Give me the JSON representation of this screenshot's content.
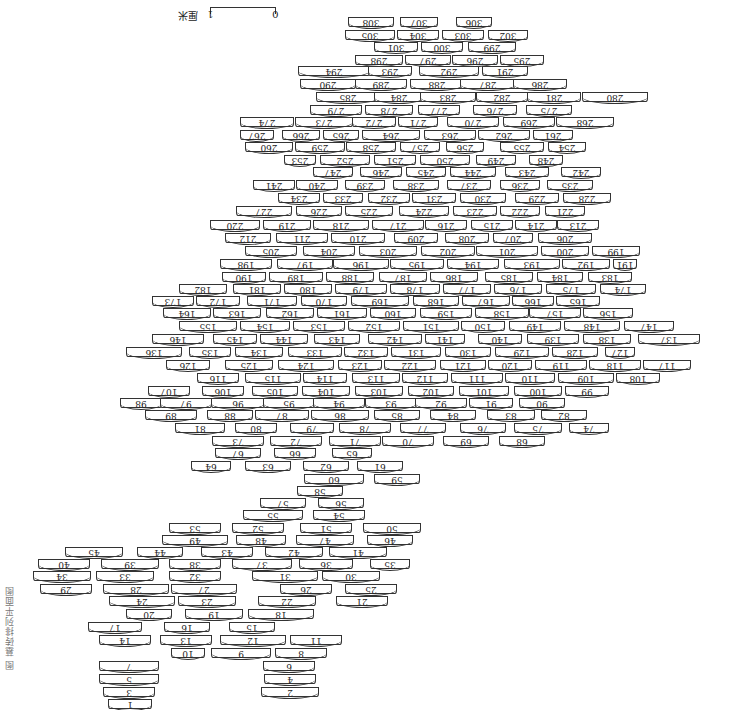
{
  "figure": {
    "orientation": "rotated 180°",
    "scale_bar": {
      "start": "0",
      "end": "1",
      "unit": "厘米"
    },
    "caption": "图 墓砖排列平面图"
  },
  "bricks": [
    [
      "308",
      348,
      17,
      46
    ],
    [
      "307",
      400,
      17,
      38
    ],
    [
      "306",
      456,
      17,
      36
    ],
    [
      "305",
      345,
      30,
      50
    ],
    [
      "304",
      397,
      30,
      42
    ],
    [
      "303",
      442,
      30,
      42
    ],
    [
      "302",
      488,
      30,
      40
    ],
    [
      "301",
      374,
      42,
      44
    ],
    [
      "300",
      421,
      42,
      42
    ],
    [
      "299",
      468,
      42,
      48
    ],
    [
      "298",
      355,
      55,
      48
    ],
    [
      "297",
      405,
      55,
      46
    ],
    [
      "296",
      452,
      55,
      46
    ],
    [
      "295",
      500,
      55,
      44
    ],
    [
      "294",
      298,
      66,
      72
    ],
    [
      "293",
      368,
      66,
      44
    ],
    [
      "292",
      419,
      66,
      60
    ],
    [
      "291",
      482,
      66,
      46
    ],
    [
      "290",
      300,
      79,
      56
    ],
    [
      "289",
      355,
      79,
      52
    ],
    [
      "288",
      410,
      79,
      54
    ],
    [
      "287",
      460,
      79,
      56
    ],
    [
      "286",
      513,
      79,
      54
    ],
    [
      "285",
      316,
      92,
      64
    ],
    [
      "284",
      374,
      92,
      50
    ],
    [
      "283",
      420,
      92,
      56
    ],
    [
      "282",
      476,
      92,
      52
    ],
    [
      "281",
      527,
      92,
      54
    ],
    [
      "280",
      582,
      92,
      66
    ],
    [
      "279",
      310,
      105,
      52
    ],
    [
      "278",
      365,
      105,
      48
    ],
    [
      "277",
      418,
      105,
      42
    ],
    [
      "276",
      473,
      105,
      44
    ],
    [
      "275",
      526,
      105,
      46
    ],
    [
      "274",
      240,
      117,
      54
    ],
    [
      "273",
      295,
      117,
      58
    ],
    [
      "272",
      352,
      117,
      44
    ],
    [
      "271",
      398,
      117,
      40
    ],
    [
      "270",
      447,
      117,
      52
    ],
    [
      "269",
      503,
      117,
      52
    ],
    [
      "268",
      556,
      117,
      58
    ],
    [
      "267",
      240,
      130,
      34
    ],
    [
      "266",
      282,
      130,
      38
    ],
    [
      "265",
      323,
      130,
      36
    ],
    [
      "264",
      362,
      130,
      58
    ],
    [
      "263",
      424,
      130,
      52
    ],
    [
      "262",
      478,
      130,
      52
    ],
    [
      "261",
      533,
      130,
      40
    ],
    [
      "260",
      245,
      142,
      48
    ],
    [
      "259",
      295,
      142,
      50
    ],
    [
      "258",
      346,
      142,
      50
    ],
    [
      "257",
      400,
      142,
      40
    ],
    [
      "256",
      446,
      142,
      38
    ],
    [
      "255",
      500,
      142,
      44
    ],
    [
      "254",
      548,
      142,
      38
    ],
    [
      "253",
      284,
      155,
      32
    ],
    [
      "252",
      320,
      155,
      50
    ],
    [
      "251",
      374,
      155,
      42
    ],
    [
      "250",
      420,
      155,
      50
    ],
    [
      "249",
      476,
      155,
      40
    ],
    [
      "248",
      529,
      155,
      34
    ],
    [
      "247",
      313,
      167,
      40
    ],
    [
      "246",
      360,
      167,
      42
    ],
    [
      "245",
      406,
      167,
      40
    ],
    [
      "244",
      450,
      167,
      46
    ],
    [
      "243",
      505,
      167,
      44
    ],
    [
      "242",
      561,
      167,
      40
    ],
    [
      "241",
      253,
      180,
      42
    ],
    [
      "240",
      296,
      180,
      42
    ],
    [
      "239",
      345,
      180,
      40
    ],
    [
      "238",
      393,
      180,
      46
    ],
    [
      "237",
      447,
      180,
      44
    ],
    [
      "236",
      500,
      180,
      40
    ],
    [
      "235",
      547,
      180,
      46
    ],
    [
      "234",
      278,
      193,
      42
    ],
    [
      "233",
      323,
      193,
      40
    ],
    [
      "232",
      368,
      193,
      42
    ],
    [
      "231",
      412,
      193,
      44
    ],
    [
      "230",
      460,
      193,
      46
    ],
    [
      "229",
      515,
      193,
      44
    ],
    [
      "228",
      563,
      193,
      48
    ],
    [
      "227",
      236,
      206,
      56
    ],
    [
      "226",
      296,
      206,
      46
    ],
    [
      "225",
      345,
      206,
      48
    ],
    [
      "224",
      399,
      206,
      50
    ],
    [
      "223",
      453,
      206,
      44
    ],
    [
      "222",
      500,
      206,
      40
    ],
    [
      "221",
      545,
      206,
      40
    ],
    [
      "220",
      210,
      220,
      50
    ],
    [
      "219",
      263,
      220,
      48
    ],
    [
      "218",
      313,
      220,
      56
    ],
    [
      "217",
      372,
      220,
      52
    ],
    [
      "216",
      425,
      220,
      42
    ],
    [
      "215",
      471,
      220,
      42
    ],
    [
      "214",
      515,
      220,
      42
    ],
    [
      "213",
      557,
      220,
      42
    ],
    [
      "212",
      225,
      233,
      46
    ],
    [
      "211",
      276,
      233,
      52
    ],
    [
      "210",
      331,
      233,
      54
    ],
    [
      "209",
      394,
      233,
      44
    ],
    [
      "208",
      445,
      233,
      44
    ],
    [
      "207",
      493,
      233,
      40
    ],
    [
      "206",
      538,
      233,
      54
    ],
    [
      "205",
      245,
      246,
      52
    ],
    [
      "204",
      303,
      246,
      52
    ],
    [
      "203",
      359,
      246,
      58
    ],
    [
      "202",
      421,
      246,
      54
    ],
    [
      "201",
      476,
      246,
      62
    ],
    [
      "200",
      541,
      246,
      48
    ],
    [
      "199",
      592,
      246,
      48
    ],
    [
      "198",
      220,
      259,
      52
    ],
    [
      "197",
      277,
      259,
      56
    ],
    [
      "196",
      333,
      259,
      56
    ],
    [
      "195",
      390,
      259,
      54
    ],
    [
      "194",
      447,
      259,
      52
    ],
    [
      "193",
      504,
      259,
      56
    ],
    [
      "192",
      562,
      259,
      48
    ],
    [
      "191",
      613,
      259,
      24
    ],
    [
      "190",
      222,
      272,
      44
    ],
    [
      "189",
      269,
      272,
      54
    ],
    [
      "188",
      326,
      272,
      48
    ],
    [
      "187",
      379,
      272,
      48
    ],
    [
      "186",
      430,
      272,
      48
    ],
    [
      "185",
      485,
      272,
      48
    ],
    [
      "184",
      537,
      272,
      46
    ],
    [
      "183",
      588,
      272,
      44
    ],
    [
      "182",
      179,
      284,
      48
    ],
    [
      "181",
      233,
      284,
      48
    ],
    [
      "180",
      284,
      284,
      48
    ],
    [
      "179",
      335,
      284,
      52
    ],
    [
      "178",
      390,
      284,
      50
    ],
    [
      "177",
      443,
      284,
      48
    ],
    [
      "176",
      494,
      284,
      48
    ],
    [
      "175",
      546,
      284,
      50
    ],
    [
      "174",
      600,
      284,
      46
    ],
    [
      "173",
      152,
      296,
      42
    ],
    [
      "172",
      196,
      296,
      44
    ],
    [
      "171",
      247,
      296,
      50
    ],
    [
      "170",
      301,
      296,
      46
    ],
    [
      "169",
      351,
      296,
      58
    ],
    [
      "168",
      413,
      296,
      46
    ],
    [
      "167",
      462,
      296,
      48
    ],
    [
      "166",
      512,
      296,
      42
    ],
    [
      "165",
      556,
      296,
      44
    ],
    [
      "164",
      163,
      308,
      48
    ],
    [
      "163",
      213,
      308,
      48
    ],
    [
      "162",
      266,
      308,
      48
    ],
    [
      "161",
      317,
      308,
      50
    ],
    [
      "160",
      370,
      308,
      46
    ],
    [
      "159",
      420,
      308,
      52
    ],
    [
      "158",
      475,
      308,
      54
    ],
    [
      "157",
      529,
      308,
      52
    ],
    [
      "156",
      583,
      308,
      50
    ],
    [
      "155",
      179,
      321,
      58
    ],
    [
      "154",
      240,
      321,
      50
    ],
    [
      "153",
      293,
      321,
      52
    ],
    [
      "152",
      348,
      321,
      52
    ],
    [
      "151",
      403,
      321,
      56
    ],
    [
      "150",
      461,
      321,
      44
    ],
    [
      "149",
      509,
      321,
      52
    ],
    [
      "148",
      564,
      321,
      56
    ],
    [
      "147",
      624,
      321,
      50
    ],
    [
      "146",
      152,
      334,
      52
    ],
    [
      "145",
      213,
      334,
      44
    ],
    [
      "144",
      260,
      334,
      48
    ],
    [
      "143",
      314,
      334,
      46
    ],
    [
      "142",
      368,
      334,
      54
    ],
    [
      "141",
      425,
      334,
      40
    ],
    [
      "140",
      478,
      334,
      44
    ],
    [
      "139",
      527,
      334,
      52
    ],
    [
      "138",
      583,
      334,
      48
    ],
    [
      "137",
      638,
      334,
      62
    ],
    [
      "136",
      126,
      347,
      56
    ],
    [
      "135",
      189,
      347,
      42
    ],
    [
      "134",
      235,
      347,
      48
    ],
    [
      "133",
      288,
      347,
      54
    ],
    [
      "132",
      344,
      347,
      44
    ],
    [
      "131",
      391,
      347,
      50
    ],
    [
      "130",
      445,
      347,
      46
    ],
    [
      "129",
      495,
      347,
      54
    ],
    [
      "128",
      552,
      347,
      46
    ],
    [
      "127",
      605,
      347,
      30
    ],
    [
      "126",
      166,
      360,
      44
    ],
    [
      "125",
      225,
      360,
      48
    ],
    [
      "124",
      278,
      360,
      56
    ],
    [
      "123",
      338,
      360,
      44
    ],
    [
      "122",
      384,
      360,
      52
    ],
    [
      "121",
      440,
      360,
      46
    ],
    [
      "120",
      488,
      360,
      44
    ],
    [
      "119",
      535,
      360,
      52
    ],
    [
      "118",
      589,
      360,
      52
    ],
    [
      "117",
      643,
      360,
      48
    ],
    [
      "116",
      197,
      373,
      42
    ],
    [
      "115",
      245,
      373,
      56
    ],
    [
      "114",
      303,
      373,
      44
    ],
    [
      "113",
      352,
      373,
      48
    ],
    [
      "112",
      402,
      373,
      46
    ],
    [
      "111",
      451,
      373,
      52
    ],
    [
      "110",
      505,
      373,
      50
    ],
    [
      "109",
      558,
      373,
      56
    ],
    [
      "108",
      616,
      373,
      44
    ],
    [
      "107",
      148,
      386,
      42
    ],
    [
      "106",
      202,
      386,
      42
    ],
    [
      "105",
      252,
      386,
      46
    ],
    [
      "104",
      302,
      386,
      48
    ],
    [
      "103",
      355,
      386,
      48
    ],
    [
      "102",
      408,
      386,
      46
    ],
    [
      "101",
      459,
      386,
      50
    ],
    [
      "100",
      514,
      386,
      48
    ],
    [
      "99",
      565,
      386,
      44
    ],
    [
      "98",
      120,
      398,
      42
    ],
    [
      "97",
      160,
      398,
      52
    ],
    [
      "96",
      211,
      398,
      54
    ],
    [
      "95",
      263,
      398,
      52
    ],
    [
      "94",
      313,
      398,
      52
    ],
    [
      "93",
      365,
      398,
      52
    ],
    [
      "92",
      415,
      398,
      52
    ],
    [
      "91",
      469,
      398,
      44
    ],
    [
      "90",
      519,
      398,
      46
    ],
    [
      "89",
      145,
      410,
      52
    ],
    [
      "88",
      207,
      410,
      46
    ],
    [
      "87",
      255,
      410,
      54
    ],
    [
      "86",
      311,
      410,
      58
    ],
    [
      "85",
      374,
      410,
      46
    ],
    [
      "84",
      430,
      410,
      46
    ],
    [
      "83",
      487,
      410,
      48
    ],
    [
      "82",
      541,
      410,
      46
    ],
    [
      "81",
      175,
      423,
      50
    ],
    [
      "80",
      235,
      423,
      42
    ],
    [
      "79",
      290,
      423,
      44
    ],
    [
      "78",
      339,
      423,
      52
    ],
    [
      "77",
      400,
      423,
      46
    ],
    [
      "76",
      460,
      423,
      46
    ],
    [
      "75",
      514,
      423,
      48
    ],
    [
      "74",
      569,
      423,
      40
    ],
    [
      "73",
      212,
      436,
      52
    ],
    [
      "72",
      270,
      436,
      52
    ],
    [
      "71",
      329,
      436,
      52
    ],
    [
      "70",
      382,
      436,
      52
    ],
    [
      "69",
      443,
      436,
      46
    ],
    [
      "68",
      499,
      436,
      46
    ],
    [
      "67",
      215,
      448,
      46
    ],
    [
      "66",
      274,
      448,
      42
    ],
    [
      "65",
      332,
      448,
      40
    ],
    [
      "64",
      191,
      461,
      40
    ],
    [
      "63",
      245,
      461,
      46
    ],
    [
      "62",
      303,
      461,
      46
    ],
    [
      "61",
      357,
      461,
      46
    ],
    [
      "60",
      304,
      474,
      60
    ],
    [
      "59",
      374,
      474,
      46
    ],
    [
      "58",
      297,
      486,
      46
    ],
    [
      "57",
      260,
      498,
      46
    ],
    [
      "56",
      318,
      498,
      46
    ],
    [
      "55",
      243,
      510,
      60
    ],
    [
      "54",
      313,
      510,
      52
    ],
    [
      "53",
      169,
      523,
      52
    ],
    [
      "52",
      232,
      523,
      52
    ],
    [
      "51",
      300,
      523,
      52
    ],
    [
      "50",
      363,
      523,
      58
    ],
    [
      "49",
      162,
      535,
      66
    ],
    [
      "48",
      236,
      535,
      50
    ],
    [
      "47",
      296,
      535,
      58
    ],
    [
      "46",
      367,
      535,
      46
    ],
    [
      "45",
      65,
      547,
      58
    ],
    [
      "44",
      137,
      547,
      46
    ],
    [
      "43",
      201,
      547,
      52
    ],
    [
      "42",
      265,
      547,
      58
    ],
    [
      "41",
      329,
      547,
      58
    ],
    [
      "40",
      38,
      559,
      52
    ],
    [
      "39",
      101,
      559,
      58
    ],
    [
      "38",
      169,
      559,
      52
    ],
    [
      "37",
      232,
      559,
      60
    ],
    [
      "36",
      299,
      559,
      54
    ],
    [
      "35",
      370,
      559,
      40
    ],
    [
      "34",
      33,
      571,
      58
    ],
    [
      "33",
      96,
      571,
      58
    ],
    [
      "32",
      169,
      571,
      52
    ],
    [
      "31",
      252,
      571,
      66
    ],
    [
      "30",
      322,
      571,
      58
    ],
    [
      "29",
      40,
      584,
      52
    ],
    [
      "28",
      103,
      584,
      66
    ],
    [
      "27",
      171,
      584,
      66
    ],
    [
      "26",
      280,
      584,
      52
    ],
    [
      "25",
      345,
      584,
      52
    ],
    [
      "24",
      109,
      596,
      66
    ],
    [
      "23",
      178,
      596,
      58
    ],
    [
      "22",
      258,
      596,
      58
    ],
    [
      "21",
      336,
      596,
      52
    ],
    [
      "20",
      126,
      609,
      46
    ],
    [
      "19",
      185,
      609,
      58
    ],
    [
      "18",
      248,
      609,
      66
    ],
    [
      "17",
      88,
      622,
      54
    ],
    [
      "16",
      164,
      622,
      46
    ],
    [
      "15",
      229,
      622,
      46
    ],
    [
      "14",
      99,
      635,
      52
    ],
    [
      "13",
      160,
      635,
      52
    ],
    [
      "12",
      220,
      635,
      66
    ],
    [
      "11",
      290,
      635,
      52
    ],
    [
      "10",
      171,
      648,
      34
    ],
    [
      "9",
      211,
      648,
      60
    ],
    [
      "8",
      275,
      648,
      52
    ],
    [
      "7",
      99,
      661,
      60
    ],
    [
      "6",
      263,
      661,
      52
    ],
    [
      "5",
      99,
      674,
      60
    ],
    [
      "4",
      264,
      674,
      52
    ],
    [
      "3",
      103,
      687,
      52
    ],
    [
      "2",
      261,
      687,
      58
    ],
    [
      "1",
      108,
      699,
      44
    ]
  ]
}
